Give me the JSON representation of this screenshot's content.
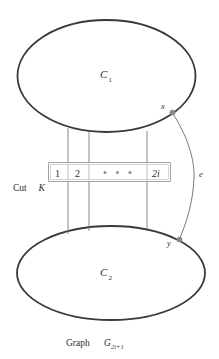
{
  "figure": {
    "caption_prefix": "Graph ",
    "caption_symbol": "G",
    "caption_subscript": "2i+1",
    "clusters": [
      {
        "id": "c1",
        "label": "C",
        "subscript": "1"
      },
      {
        "id": "c2",
        "label": "C",
        "subscript": "2"
      }
    ],
    "nodes": [
      {
        "id": "x",
        "label": "x"
      },
      {
        "id": "y",
        "label": "y"
      }
    ],
    "edge": {
      "id": "e",
      "label": "e"
    },
    "cut": {
      "name_prefix": "Cut ",
      "name_symbol": "K",
      "cells": [
        {
          "label": "1",
          "italic": false
        },
        {
          "label": "2",
          "italic": false
        },
        {
          "label": "• • •",
          "italic": false
        },
        {
          "label": "2i",
          "italic": true
        }
      ],
      "edge_count_label": "2i"
    },
    "colors": {
      "ellipse_stroke": "#3a3a3a",
      "cut_line": "#6b6b6b",
      "cut_box_stroke": "#9a9a9a",
      "node_dot": "#8a8a8a",
      "text": "#2f2f2f",
      "background": "#ffffff"
    }
  }
}
